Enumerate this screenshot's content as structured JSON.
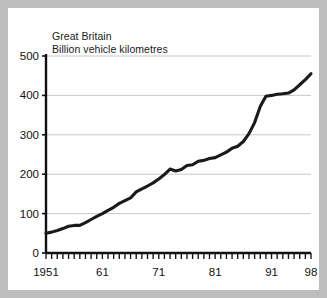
{
  "figure": {
    "background_color": "#bdbdbd",
    "plot_background_color": "#ffffff",
    "line_color": "#1a1a1a",
    "grid_color": "#c9c9c9",
    "axis_color": "#111111"
  },
  "headings": {
    "line1": "Great Britain",
    "line2": "Billion vehicle kilometres"
  },
  "chart_data": {
    "type": "line",
    "title": "Great Britain",
    "subtitle": "Billion vehicle kilometres",
    "xlabel": "",
    "ylabel": "Billion vehicle kilometres",
    "xlim": [
      1951,
      1998
    ],
    "ylim": [
      0,
      500
    ],
    "yticks": [
      0,
      100,
      200,
      300,
      400,
      500
    ],
    "ytick_labels": [
      "0",
      "100",
      "200",
      "300",
      "400",
      "500"
    ],
    "xticks": [
      1951,
      1961,
      1971,
      1981,
      1991,
      1998
    ],
    "xtick_labels": [
      "1951",
      "61",
      "71",
      "81",
      "91",
      "98"
    ],
    "minor_xticks_interval": 1,
    "grid": "horizontal",
    "legend": "none",
    "series": [
      {
        "name": "Road traffic",
        "x": [
          1951,
          1952,
          1953,
          1954,
          1955,
          1956,
          1957,
          1958,
          1959,
          1960,
          1961,
          1962,
          1963,
          1964,
          1965,
          1966,
          1967,
          1968,
          1969,
          1970,
          1971,
          1972,
          1973,
          1974,
          1975,
          1976,
          1977,
          1978,
          1979,
          1980,
          1981,
          1982,
          1983,
          1984,
          1985,
          1986,
          1987,
          1988,
          1989,
          1990,
          1991,
          1992,
          1993,
          1994,
          1995,
          1996,
          1997,
          1998
        ],
        "values": [
          50,
          53,
          57,
          62,
          68,
          70,
          70,
          77,
          85,
          93,
          100,
          108,
          116,
          126,
          133,
          140,
          155,
          163,
          170,
          178,
          188,
          199,
          213,
          208,
          212,
          222,
          224,
          233,
          235,
          240,
          242,
          249,
          256,
          266,
          271,
          283,
          303,
          331,
          372,
          398,
          400,
          403,
          404,
          406,
          414,
          427,
          440,
          455
        ]
      }
    ]
  },
  "axis": {
    "y_tick_labels": [
      "500",
      "400",
      "300",
      "200",
      "100",
      "0"
    ],
    "x_tick_labels": [
      "1951",
      "61",
      "71",
      "81",
      "91",
      "98"
    ]
  }
}
